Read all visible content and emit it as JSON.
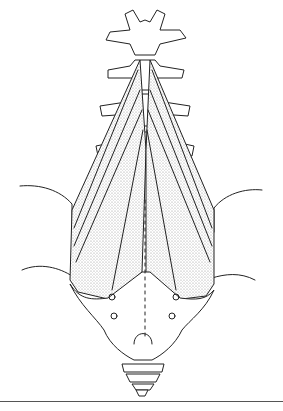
{
  "figure": {
    "style": "black line drawing with stippled muscle shading",
    "colors": {
      "ink": "#222222",
      "background": "#ffffff",
      "stipple": "#bbbbbb",
      "rule": "#555555"
    }
  }
}
